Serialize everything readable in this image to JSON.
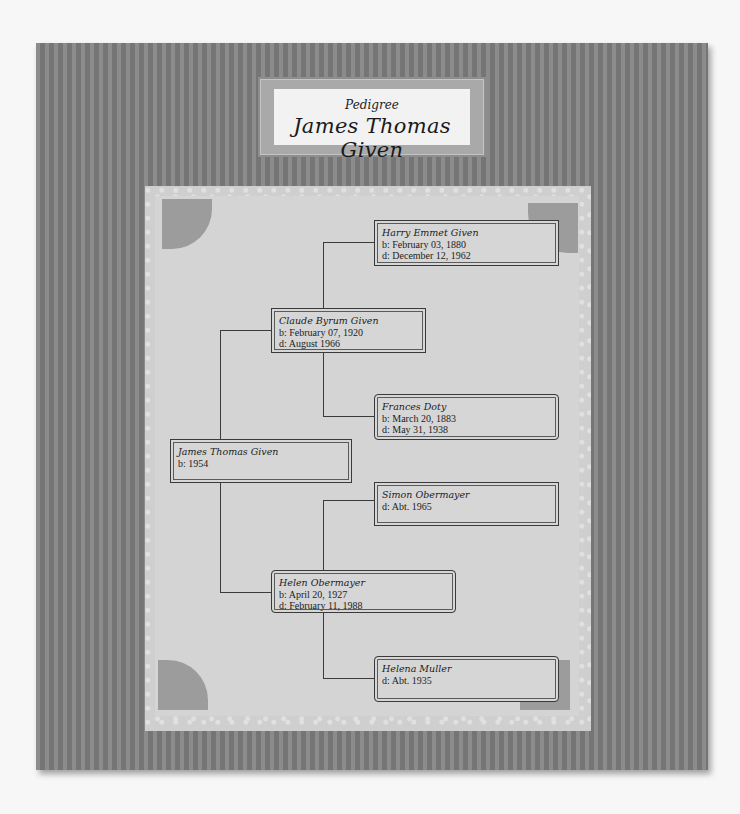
{
  "header": {
    "subtitle": "Pedigree",
    "title": "James Thomas Given"
  },
  "colors": {
    "frame": "#7f7f7f",
    "paper": "#d4d4d4",
    "title_bg": "#f2f2f2",
    "line": "#3a3a3a"
  },
  "people": {
    "root": {
      "name": "James Thomas Given",
      "lines": [
        "b: 1954"
      ]
    },
    "father": {
      "name": "Claude Byrum Given",
      "lines": [
        "b: February 07, 1920",
        "d: August 1966"
      ]
    },
    "mother": {
      "name": "Helen Obermayer",
      "lines": [
        "b: April 20, 1927",
        "d: February 11, 1988"
      ]
    },
    "paternal_grandfather": {
      "name": "Harry Emmet Given",
      "lines": [
        "b: February 03, 1880",
        "d: December 12, 1962"
      ]
    },
    "paternal_grandmother": {
      "name": "Frances Doty",
      "lines": [
        "b: March 20, 1883",
        "d: May 31, 1938"
      ]
    },
    "maternal_grandfather": {
      "name": "Simon Obermayer",
      "lines": [
        "d: Abt. 1965"
      ]
    },
    "maternal_grandmother": {
      "name": "Helena Muller",
      "lines": [
        "d: Abt. 1935"
      ]
    }
  }
}
